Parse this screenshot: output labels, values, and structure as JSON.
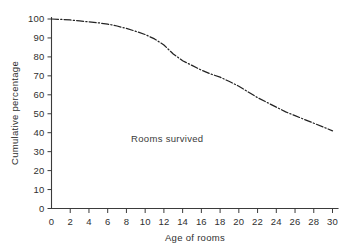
{
  "chart_data": {
    "type": "line",
    "title": "",
    "subtitle": "",
    "xlabel": "Age of rooms",
    "ylabel": "Cumulative percentage",
    "xlim": [
      0,
      30
    ],
    "ylim": [
      0,
      100
    ],
    "grid": false,
    "legend_position": "none",
    "line_style": "dash-dot",
    "line_color": "#232323",
    "background_color": "#ffffff",
    "axis_color": "#3b3b3b",
    "annotations": [
      {
        "text": "Rooms survived",
        "x": 8.5,
        "y": 35
      }
    ],
    "xticks": [
      0,
      2,
      4,
      6,
      8,
      10,
      12,
      14,
      16,
      18,
      20,
      22,
      24,
      26,
      28,
      30
    ],
    "xticklabels": [
      "0",
      "2",
      "4",
      "6",
      "8",
      "10",
      "12",
      "14",
      "16",
      "18",
      "20",
      "22",
      "24",
      "26",
      "28",
      "30"
    ],
    "yticks": [
      0,
      10,
      20,
      30,
      40,
      50,
      60,
      70,
      80,
      90,
      100
    ],
    "yticklabels": [
      "0",
      "10",
      "20",
      "30",
      "40",
      "50",
      "60",
      "70",
      "80",
      "90",
      "100"
    ],
    "series": [
      {
        "name": "Rooms survived",
        "x": [
          0,
          1,
          2,
          3,
          4,
          5,
          6,
          7,
          8,
          9,
          10,
          11,
          12,
          13,
          14,
          15,
          16,
          17,
          18,
          19,
          20,
          21,
          22,
          23,
          24,
          25,
          26,
          27,
          28,
          29,
          30
        ],
        "values": [
          100,
          99.8,
          99.5,
          99,
          98.5,
          98,
          97.3,
          96.3,
          95,
          93.5,
          91.8,
          89.5,
          86.3,
          81.5,
          78,
          75.5,
          73,
          71,
          69.3,
          67,
          64.5,
          61.5,
          58.5,
          56,
          53.5,
          51,
          49,
          47,
          45,
          43,
          41
        ]
      }
    ]
  },
  "axes": {
    "ylabel": "Cumulative percentage",
    "xlabel": "Age of rooms"
  },
  "annotation": {
    "rooms_survived": "Rooms survived"
  }
}
